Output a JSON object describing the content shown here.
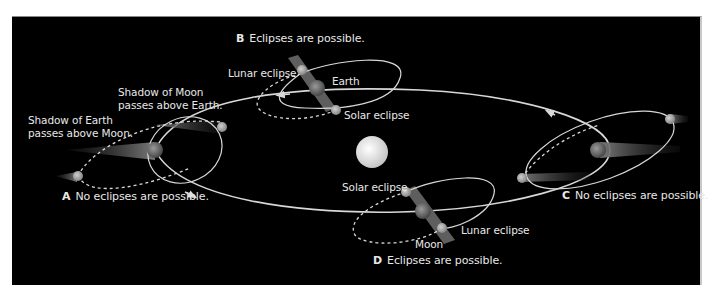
{
  "diagram": {
    "positions": {
      "A": {
        "letter": "A",
        "caption": "No eclipses are possible."
      },
      "B": {
        "letter": "B",
        "caption": "Eclipses are possible."
      },
      "C": {
        "letter": "C",
        "caption": "No eclipses are possible."
      },
      "D": {
        "letter": "D",
        "caption": "Eclipses are possible."
      }
    },
    "labels": {
      "shadow_earth_line1": "Shadow of Earth",
      "shadow_earth_line2": "passes above Moon.",
      "shadow_moon_line1": "Shadow of Moon",
      "shadow_moon_line2": "passes above Earth.",
      "b_lunar_eclipse": "Lunar eclipse",
      "b_earth": "Earth",
      "b_solar_eclipse": "Solar eclipse",
      "d_solar_eclipse": "Solar eclipse",
      "d_lunar_eclipse": "Lunar eclipse",
      "d_moon": "Moon"
    },
    "colors": {
      "background": "#000000",
      "orbit": "#d8d8d8",
      "sun": "#eeeeee",
      "shadow": "#6a6a6a",
      "text": "#e8e8e8"
    }
  }
}
